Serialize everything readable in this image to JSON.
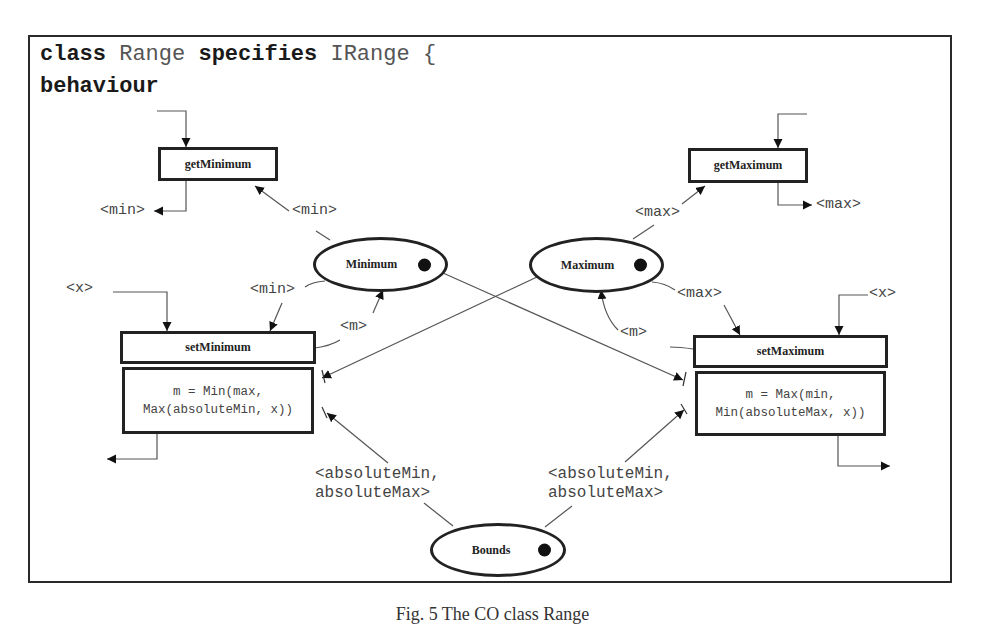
{
  "header": {
    "line1": [
      {
        "text": "class",
        "bold": true
      },
      {
        "text": " Range ",
        "bold": false
      },
      {
        "text": "specifies",
        "bold": true
      },
      {
        "text": " IRange {",
        "bold": false
      }
    ],
    "line2": "behaviour",
    "kw_class": "class",
    "class_name": "Range",
    "kw_specifies": "specifies",
    "interface_name": "IRange",
    "open_brace": "{",
    "kw_behaviour": "behaviour"
  },
  "operations": {
    "getMinimum": {
      "label": "getMinimum",
      "input_label": "",
      "output_label": "<min>"
    },
    "getMaximum": {
      "label": "getMaximum",
      "input_label": "",
      "output_label": "<max>"
    },
    "setMinimum": {
      "label": "setMinimum",
      "body_line1": "m = Min(max,",
      "body_line2": "Max(absoluteMin, x))",
      "input_label": "<x>"
    },
    "setMaximum": {
      "label": "setMaximum",
      "body_line1": "m = Max(min,",
      "body_line2": "Min(absoluteMax, x))",
      "input_label": "<x>"
    }
  },
  "states": {
    "minimum": {
      "label": "Minimum"
    },
    "maximum": {
      "label": "Maximum"
    },
    "bounds": {
      "label": "Bounds"
    }
  },
  "edge_labels": {
    "minimum_to_getMinimum": "<min>",
    "maximum_to_getMaximum": "<max>",
    "minimum_to_setMinimum": "<min>",
    "setMinimum_to_minimum": "<m>",
    "maximum_to_setMaximum": "<max>",
    "setMaximum_to_maximum": "<m>",
    "bounds_to_setMinimum": "<absoluteMin,\nabsoluteMax>",
    "bounds_to_setMaximum": "<absoluteMin,\nabsoluteMax>"
  },
  "caption": "Fig. 5 The CO class Range"
}
